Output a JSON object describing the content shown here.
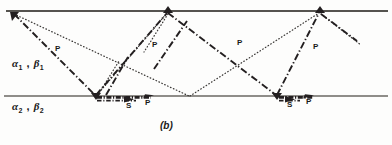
{
  "figure": {
    "caption": "(b)",
    "width": 392,
    "height": 145,
    "ink_color": "#231f20",
    "surface_color": "#5a5a5a"
  },
  "layers": [
    {
      "name": "upper-layer",
      "label_alpha": "α",
      "label_beta": "β",
      "sub": "1",
      "text": "α₁ , β₁",
      "x": 12,
      "y": 63
    },
    {
      "name": "lower-layer",
      "label_alpha": "α",
      "label_beta": "β",
      "sub": "2",
      "text": "α₂ , β₂",
      "x": 12,
      "y": 101
    }
  ],
  "ray_labels": [
    {
      "text": "P",
      "x": 55,
      "y": 49
    },
    {
      "text": "P",
      "x": 152,
      "y": 45
    },
    {
      "text": "P",
      "x": 237,
      "y": 43
    },
    {
      "text": "P",
      "x": 313,
      "y": 47
    }
  ],
  "phase_labels": [
    {
      "text": "S",
      "x": 126,
      "y": 106
    },
    {
      "text": "P",
      "x": 145,
      "y": 103
    },
    {
      "text": "S",
      "x": 287,
      "y": 105
    },
    {
      "text": "P",
      "x": 306,
      "y": 102
    }
  ],
  "geometry": {
    "free_surface": {
      "x1": 6,
      "y1": 11,
      "x2": 388,
      "y2": 11
    },
    "interface": {
      "x1": 4,
      "y1": 96,
      "x2": 388,
      "y2": 96
    },
    "surface_points": [
      {
        "x": 13,
        "y": 13
      },
      {
        "x": 168,
        "y": 12
      },
      {
        "x": 320,
        "y": 12
      }
    ],
    "interface_points": [
      {
        "x": 96,
        "y": 96
      },
      {
        "x": 190,
        "y": 97
      },
      {
        "x": 277,
        "y": 96
      }
    ],
    "dashdot_rays": [
      {
        "from": {
          "x": 13,
          "y": 13
        },
        "to": {
          "x": 96,
          "y": 96
        }
      },
      {
        "from": {
          "x": 96,
          "y": 96
        },
        "to": {
          "x": 168,
          "y": 12
        }
      },
      {
        "from": {
          "x": 168,
          "y": 12
        },
        "to": {
          "x": 277,
          "y": 96
        }
      },
      {
        "from": {
          "x": 277,
          "y": 96
        },
        "to": {
          "x": 320,
          "y": 12
        }
      },
      {
        "from": {
          "x": 320,
          "y": 12
        },
        "to": {
          "x": 356,
          "y": 40
        }
      },
      {
        "from": {
          "x": 105,
          "y": 96
        },
        "to": {
          "x": 127,
          "y": 58
        }
      },
      {
        "from": {
          "x": 155,
          "y": 68
        },
        "to": {
          "x": 186,
          "y": 22
        }
      }
    ],
    "dotted_rays": [
      {
        "from": {
          "x": 13,
          "y": 13
        },
        "to": {
          "x": 190,
          "y": 97
        }
      },
      {
        "from": {
          "x": 190,
          "y": 97
        },
        "to": {
          "x": 320,
          "y": 12
        }
      },
      {
        "from": {
          "x": 96,
          "y": 96
        },
        "to": {
          "x": 168,
          "y": 12
        }
      },
      {
        "from": {
          "x": 168,
          "y": 12
        },
        "to": {
          "x": 143,
          "y": 52
        }
      },
      {
        "from": {
          "x": 96,
          "y": 96
        },
        "to": {
          "x": 120,
          "y": 60
        }
      },
      {
        "from": {
          "x": 320,
          "y": 12
        },
        "to": {
          "x": 360,
          "y": 44
        }
      }
    ],
    "head_waves": [
      {
        "name": "head-wave-left",
        "x1": 98,
        "x2": 152,
        "y": 99
      },
      {
        "name": "head-wave-right",
        "x1": 279,
        "x2": 313,
        "y": 99
      }
    ],
    "arrows": [
      {
        "name": "arrow-s-left",
        "x": 129,
        "y": 99,
        "angle": 0
      },
      {
        "name": "arrow-p-left",
        "x": 150,
        "y": 97,
        "angle": -12
      },
      {
        "name": "arrow-s-right",
        "x": 290,
        "y": 99,
        "angle": 0
      },
      {
        "name": "arrow-p-right",
        "x": 309,
        "y": 97,
        "angle": -12
      }
    ]
  }
}
